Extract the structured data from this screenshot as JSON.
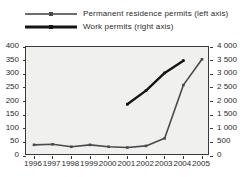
{
  "chart_data": {
    "type": "line",
    "title": "",
    "subtitle": "",
    "xlabel": "",
    "ylabel": "",
    "grid": false,
    "legend_position": "top-left",
    "categories": [
      "1996",
      "1997",
      "1998",
      "1999",
      "2000",
      "2001",
      "2002",
      "2003",
      "2004",
      "2005"
    ],
    "x": [
      1996,
      1997,
      1998,
      1999,
      2000,
      2001,
      2002,
      2003,
      2004,
      2005
    ],
    "axes": {
      "left": {
        "label": "",
        "lim": [
          0,
          400
        ],
        "step": 50,
        "ticks": [
          "0",
          "50",
          "100",
          "150",
          "200",
          "250",
          "300",
          "350",
          "400"
        ],
        "tick_values": [
          0,
          50,
          100,
          150,
          200,
          250,
          300,
          350,
          400
        ]
      },
      "right": {
        "label": "",
        "lim": [
          0,
          4000
        ],
        "step": 500,
        "ticks": [
          "0",
          "500",
          "1 000",
          "1 500",
          "2 000",
          "2 500",
          "3 000",
          "3 500",
          "4 000"
        ],
        "tick_values": [
          0,
          500,
          1000,
          1500,
          2000,
          2500,
          3000,
          3500,
          4000
        ]
      }
    },
    "series": [
      {
        "name": "Permanent residence permits (left axis)",
        "legend_label": "Permanent residence permits (left axis)",
        "axis": "left",
        "color": "#4a4a4a",
        "line_width": 1.6,
        "marker": "square",
        "x": [
          1996,
          1997,
          1998,
          1999,
          2000,
          2001,
          2002,
          2003,
          2004,
          2005
        ],
        "values": [
          41,
          43,
          34,
          41,
          34,
          31,
          37,
          65,
          260,
          355
        ]
      },
      {
        "name": "Work permits (right axis)",
        "legend_label": "Work permits (right axis)",
        "axis": "right",
        "color": "#141414",
        "line_width": 2.4,
        "marker": "square",
        "x": [
          2001,
          2002,
          2003,
          2004
        ],
        "values": [
          1900,
          2400,
          3050,
          3500
        ]
      }
    ]
  },
  "legend": {
    "items": [
      {
        "label": "Permanent residence permits (left axis)",
        "swatch": "perm"
      },
      {
        "label": "Work permits (right axis)",
        "swatch": "work"
      }
    ]
  }
}
